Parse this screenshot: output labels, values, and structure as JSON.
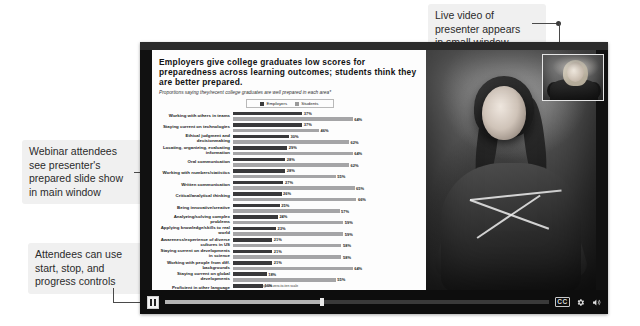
{
  "annotations": {
    "video": "Live video of\npresenter appears\nin small window",
    "slides": "Webinar attendees\nsee presenter's\nprepared slide show\nin main window",
    "controls": "Attendees can use\nstart, stop, and\nprogress controls"
  },
  "player": {
    "play_pause_icon": "pause-icon",
    "cc_label": "CC",
    "settings_icon": "gear-icon",
    "volume_icon": "volume-icon",
    "progress_percent": 41
  },
  "presenter": {
    "window_label": "presenter-video-thumbnail"
  },
  "chart_data": {
    "type": "bar",
    "title": "Employers give college graduates low scores for preparedness across learning outcomes; students think they are better prepared.",
    "subtitle": "Proportions saying they/recent college graduates are well prepared in each area*",
    "footnote": "*8-10 ratings on zero-to-ten scale",
    "xlabel": "",
    "ylabel": "",
    "xlim": [
      0,
      100
    ],
    "grid": false,
    "legend_position": "top-center",
    "categories": [
      "Working with others in teams",
      "Staying current on technologies",
      "Ethical judgment and decisionmaking",
      "Locating, organizing, evaluating information",
      "Oral communication",
      "Working with numbers/statistics",
      "Written communication",
      "Critical/analytical thinking",
      "Being innovative/creative",
      "Analyzing/solving complex problems",
      "Applying knowledge/skills to real world",
      "Awareness/experience of diverse cultures in US",
      "Staying current on developments in science",
      "Working with people from diff. backgrounds",
      "Staying current on global developments",
      "Proficient in other language",
      "Awareness/experience of diverse cultures outside US"
    ],
    "series": [
      {
        "name": "Employers",
        "color": "#39393b",
        "values": [
          37,
          37,
          30,
          29,
          28,
          28,
          27,
          26,
          25,
          24,
          23,
          21,
          21,
          21,
          18,
          16,
          15
        ]
      },
      {
        "name": "Students",
        "color": "#a5a5a7",
        "values": [
          64,
          46,
          62,
          64,
          62,
          55,
          65,
          66,
          57,
          59,
          59,
          58,
          58,
          64,
          55,
          34,
          42
        ]
      }
    ]
  }
}
